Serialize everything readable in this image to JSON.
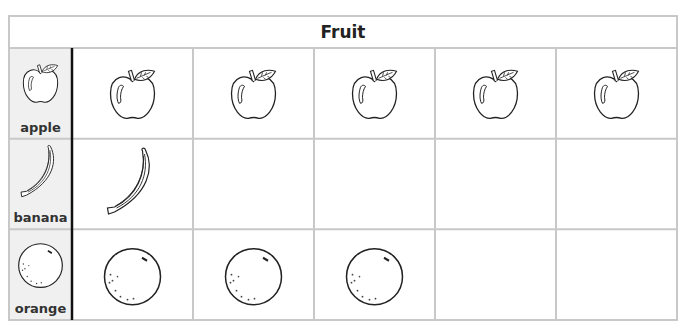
{
  "chart_data": {
    "type": "table",
    "subtype": "pictograph",
    "title": "Fruit",
    "categories": [
      "apple",
      "banana",
      "orange"
    ],
    "values": [
      5,
      1,
      3
    ],
    "max_columns": 5,
    "icons": [
      "apple-icon",
      "banana-icon",
      "orange-icon"
    ],
    "grid": true,
    "colors": {
      "grid": "#c8c8c8",
      "label_bg": "#f0f0f0",
      "divider": "#111111",
      "stroke": "#222222"
    }
  }
}
